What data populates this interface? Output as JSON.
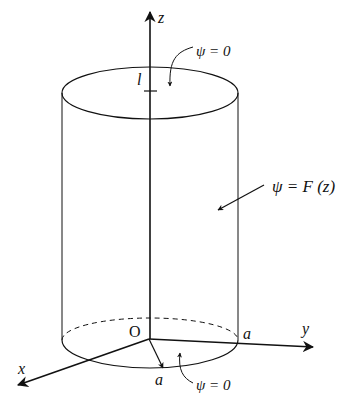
{
  "diagram": {
    "type": "cylinder-boundary-conditions",
    "background": "#ffffff",
    "stroke_color": "#111111",
    "axes": {
      "z_label": "z",
      "y_label": "y",
      "x_label": "x",
      "origin_label": "O"
    },
    "dimensions": {
      "height_label": "l",
      "radius_label_y": "a",
      "radius_label_x": "a"
    },
    "annotations": {
      "top": "ψ = 0",
      "side": "ψ = F (z)",
      "bottom": "ψ = 0"
    }
  }
}
